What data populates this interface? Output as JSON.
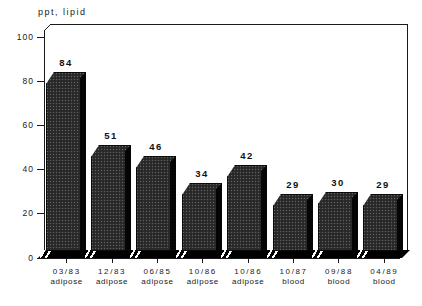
{
  "chart_data": {
    "type": "bar",
    "title": "",
    "ylabel": "ppt, lipid",
    "xlabel": "",
    "ylim": [
      0,
      100
    ],
    "y_ticks": [
      0,
      20,
      40,
      60,
      80,
      100
    ],
    "grid": false,
    "legend": null,
    "style": "monochrome 3d dithered columns on white",
    "categories": [
      "03/83 adipose",
      "12/83 adipose",
      "06/85 adipose",
      "10/86 adipose",
      "10/86 adipose",
      "10/87 blood",
      "09/88 blood",
      "04/89 blood"
    ],
    "values": [
      84,
      51,
      46,
      34,
      42,
      29,
      30,
      29
    ],
    "bars": [
      {
        "date": "03/83",
        "tissue": "adipose",
        "value": 84
      },
      {
        "date": "12/83",
        "tissue": "adipose",
        "value": 51
      },
      {
        "date": "06/85",
        "tissue": "adipose",
        "value": 46
      },
      {
        "date": "10/86",
        "tissue": "adipose",
        "value": 34
      },
      {
        "date": "10/86",
        "tissue": "adipose",
        "value": 42
      },
      {
        "date": "10/87",
        "tissue": "blood",
        "value": 29
      },
      {
        "date": "09/88",
        "tissue": "blood",
        "value": 30
      },
      {
        "date": "04/89",
        "tissue": "blood",
        "value": 29
      }
    ]
  },
  "colors": {
    "background": "#ffffff",
    "bar_fill": "#2f2f2f",
    "bar_side": "#050505",
    "axis": "#1a1a1a",
    "text": "#1a1a1a"
  }
}
